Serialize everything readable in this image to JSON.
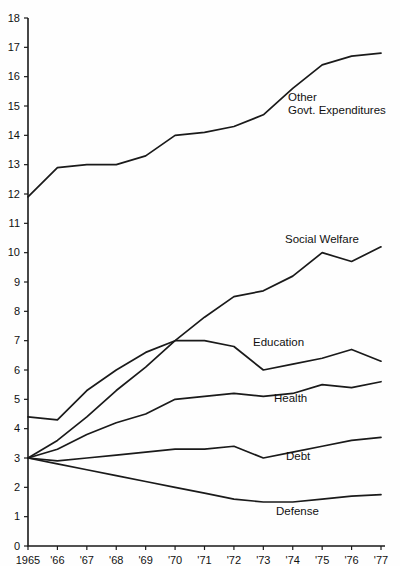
{
  "chart_data": {
    "type": "line",
    "title": "",
    "xlabel": "",
    "ylabel": "",
    "xlim": [
      1965,
      1977
    ],
    "ylim": [
      0,
      18
    ],
    "grid": false,
    "legend_position": "inline-right",
    "x": [
      1965,
      1966,
      1967,
      1968,
      1969,
      1970,
      1971,
      1972,
      1973,
      1974,
      1975,
      1976,
      1977
    ],
    "xtick_labels": [
      "1965",
      "'66",
      "'67",
      "'68",
      "'69",
      "'70",
      "'71",
      "'72",
      "'73",
      "'74",
      "'75",
      "'76",
      "'77"
    ],
    "ytick_labels": [
      "0",
      "1",
      "2",
      "3",
      "4",
      "5",
      "6",
      "7",
      "8",
      "9",
      "10",
      "11",
      "12",
      "13",
      "14",
      "15",
      "16",
      "17",
      "18"
    ],
    "ytick_values": [
      0,
      1,
      2,
      3,
      4,
      5,
      6,
      7,
      8,
      9,
      10,
      11,
      12,
      13,
      14,
      15,
      16,
      17,
      18
    ],
    "series": [
      {
        "name": "Other Govt. Expenditures",
        "label_lines": [
          "Other",
          "Govt. Expenditures"
        ],
        "values": [
          11.9,
          12.9,
          13.0,
          13.0,
          13.3,
          14.0,
          14.1,
          14.3,
          14.7,
          15.6,
          16.4,
          16.7,
          16.8
        ]
      },
      {
        "name": "Social Welfare",
        "label_lines": [
          "Social Welfare"
        ],
        "values": [
          3.0,
          3.6,
          4.4,
          5.3,
          6.1,
          7.0,
          7.8,
          8.5,
          8.7,
          9.2,
          10.0,
          9.7,
          10.2
        ]
      },
      {
        "name": "Education",
        "label_lines": [
          "Education"
        ],
        "values": [
          4.4,
          4.3,
          5.3,
          6.0,
          6.6,
          7.0,
          7.0,
          6.8,
          6.0,
          6.2,
          6.4,
          6.7,
          6.3
        ]
      },
      {
        "name": "Health",
        "label_lines": [
          "Health"
        ],
        "values": [
          3.0,
          3.3,
          3.8,
          4.2,
          4.5,
          5.0,
          5.1,
          5.2,
          5.1,
          5.2,
          5.5,
          5.4,
          5.6
        ]
      },
      {
        "name": "Debt",
        "label_lines": [
          "Debt"
        ],
        "values": [
          3.0,
          2.9,
          3.0,
          3.1,
          3.2,
          3.3,
          3.3,
          3.4,
          3.0,
          3.2,
          3.4,
          3.6,
          3.7
        ]
      },
      {
        "name": "Defense",
        "label_lines": [
          "Defense"
        ],
        "values": [
          3.0,
          2.8,
          2.6,
          2.4,
          2.2,
          2.0,
          1.8,
          1.6,
          1.5,
          1.5,
          1.6,
          1.7,
          1.75
        ]
      }
    ],
    "series_label_positions": [
      {
        "name": "Other Govt. Expenditures",
        "x": 288,
        "y": 91
      },
      {
        "name": "Social Welfare",
        "x": 285,
        "y": 233
      },
      {
        "name": "Education",
        "x": 253,
        "y": 336
      },
      {
        "name": "Health",
        "x": 274,
        "y": 392
      },
      {
        "name": "Debt",
        "x": 286,
        "y": 450
      },
      {
        "name": "Defense",
        "x": 276,
        "y": 505
      }
    ]
  }
}
